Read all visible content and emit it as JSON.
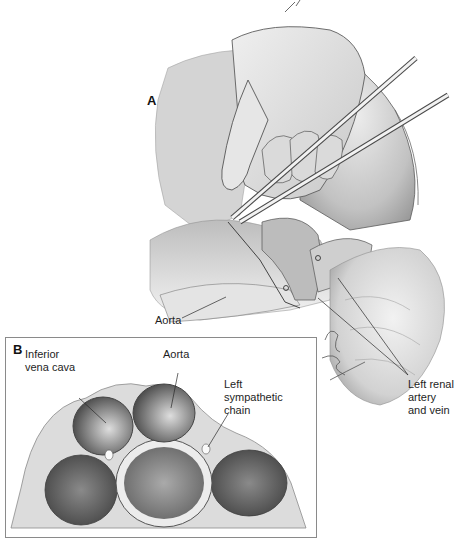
{
  "figure": {
    "panel_a": {
      "letter": "A",
      "labels": {
        "aorta": "Aorta",
        "left_renal": "Left renal\nartery\nand vein"
      },
      "signature": "RBL 07-08 Reddan"
    },
    "panel_b": {
      "letter": "B",
      "labels": {
        "ivc": "Inferior\nvena cava",
        "aorta": "Aorta",
        "sympathetic": "Left\nsympathetic\nchain"
      }
    },
    "colors": {
      "line": "#2a2a2a",
      "tissue_light": "#d9d9d9",
      "tissue_mid": "#b5b5b5",
      "tissue_dark": "#6e6e6e",
      "inset_border": "#8a8a8a"
    }
  }
}
